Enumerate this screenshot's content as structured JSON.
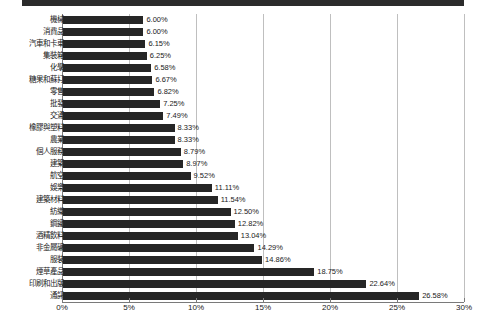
{
  "chart_data": {
    "type": "bar",
    "orientation": "horizontal",
    "title": "",
    "subtitle": "",
    "xlabel": "",
    "ylabel": "",
    "xlim": [
      0,
      30
    ],
    "xunit": "%",
    "grid": true,
    "legend": null,
    "xticks": [
      "0%",
      "5%",
      "10%",
      "15%",
      "20%",
      "25%",
      "30%"
    ],
    "xtick_values": [
      0,
      5,
      10,
      15,
      20,
      25,
      30
    ],
    "categories": [
      "機械",
      "消費品",
      "汽車和卡車",
      "集裝箱",
      "化學",
      "糖果和蘇打",
      "零售",
      "批發",
      "交通",
      "橡膠與塑料",
      "農業",
      "個人服務",
      "建築",
      "航空",
      "娛樂",
      "建築材料",
      "紡織",
      "鋼鐵",
      "酒精飲料",
      "非金屬礦",
      "服裝",
      "煙草產品",
      "印刷和出版",
      "通訊"
    ],
    "values": [
      6.0,
      6.0,
      6.15,
      6.25,
      6.58,
      6.67,
      6.82,
      7.25,
      7.49,
      8.33,
      8.33,
      8.79,
      8.97,
      9.52,
      11.11,
      11.54,
      12.5,
      12.82,
      13.04,
      14.29,
      14.86,
      18.75,
      22.64,
      26.58
    ],
    "value_labels": [
      "6.00%",
      "6.00%",
      "6.15%",
      "6.25%",
      "6.58%",
      "6.67%",
      "6.82%",
      "7.25%",
      "7.49%",
      "8.33%",
      "8.33%",
      "8.79%",
      "8.97%",
      "9.52%",
      "11.11%",
      "11.54%",
      "12.50%",
      "12.82%",
      "13.04%",
      "14.29%",
      "14.86%",
      "18.75%",
      "22.64%",
      "26.58%"
    ],
    "bar_color": "#262626",
    "grid_color": "#bfbfbf",
    "axis_color": "#7a7a7a",
    "text_color": "#1a1a1a",
    "background": "#ffffff"
  }
}
